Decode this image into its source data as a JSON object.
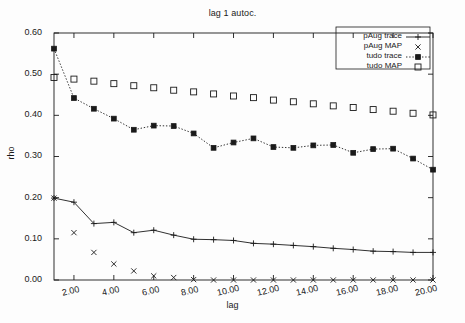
{
  "chart_data": {
    "type": "line",
    "title": "lag 1 autoc.",
    "xlabel": "lag",
    "ylabel": "rho",
    "xlim": [
      1,
      20
    ],
    "ylim": [
      0.0,
      0.6
    ],
    "grid": false,
    "legend_position": "top-right",
    "x": [
      1,
      2,
      3,
      4,
      5,
      6,
      7,
      8,
      9,
      10,
      11,
      12,
      13,
      14,
      15,
      16,
      17,
      18,
      19,
      20
    ],
    "xticks": [
      2,
      4,
      6,
      8,
      10,
      12,
      14,
      16,
      18,
      20
    ],
    "xtick_labels": [
      "2.00",
      "4.00",
      "6.00",
      "8.00",
      "10.00",
      "12.00",
      "14.00",
      "16.00",
      "18.00",
      "20.00"
    ],
    "yticks": [
      0.0,
      0.1,
      0.2,
      0.3,
      0.4,
      0.5,
      0.6
    ],
    "ytick_labels": [
      "0.00",
      "0.10",
      "0.20",
      "0.30",
      "0.40",
      "0.50",
      "0.60"
    ],
    "series": [
      {
        "name": "pAug trace",
        "style": "solid-line-plus",
        "marker": "plus",
        "line": "solid",
        "color": "#1a1a1a",
        "values": [
          0.199,
          0.189,
          0.137,
          0.14,
          0.115,
          0.121,
          0.109,
          0.099,
          0.098,
          0.096,
          0.089,
          0.087,
          0.084,
          0.081,
          0.077,
          0.074,
          0.07,
          0.069,
          0.067,
          0.067
        ]
      },
      {
        "name": "pAug MAP",
        "style": "points-cross",
        "marker": "cross",
        "line": "none",
        "color": "#1a1a1a",
        "values": [
          0.199,
          0.115,
          0.067,
          0.039,
          0.022,
          0.01,
          0.006,
          0.001,
          0.0,
          0.0,
          0.0,
          0.0,
          0.0,
          0.0,
          0.0,
          0.0,
          0.0,
          0.0,
          0.0,
          0.0
        ]
      },
      {
        "name": "tudo trace",
        "style": "dotted-line-filled-square",
        "marker": "filled-square",
        "line": "dotted",
        "color": "#1a1a1a",
        "values": [
          0.562,
          0.442,
          0.416,
          0.392,
          0.365,
          0.375,
          0.374,
          0.356,
          0.321,
          0.334,
          0.344,
          0.323,
          0.321,
          0.327,
          0.328,
          0.309,
          0.318,
          0.319,
          0.295,
          0.268
        ]
      },
      {
        "name": "tudo MAP",
        "style": "points-open-square",
        "marker": "open-square",
        "line": "none",
        "color": "#1a1a1a",
        "values": [
          0.492,
          0.488,
          0.483,
          0.477,
          0.472,
          0.467,
          0.461,
          0.457,
          0.452,
          0.447,
          0.443,
          0.437,
          0.433,
          0.428,
          0.423,
          0.419,
          0.414,
          0.41,
          0.405,
          0.401
        ]
      }
    ]
  },
  "legend": {
    "entries": [
      {
        "label": "pAug trace"
      },
      {
        "label": "pAug MAP"
      },
      {
        "label": "tudo trace"
      },
      {
        "label": "tudo MAP"
      }
    ]
  },
  "axes": {
    "frame_color": "#1a1a1a"
  }
}
